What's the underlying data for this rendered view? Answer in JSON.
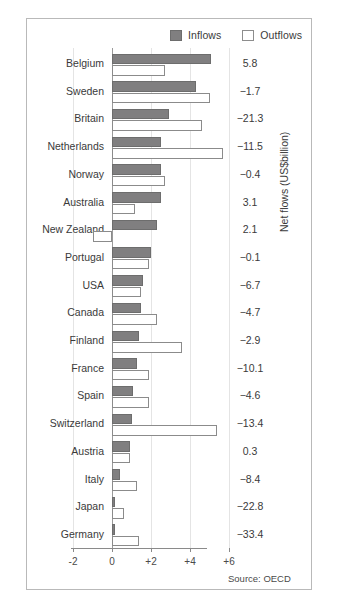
{
  "legend": {
    "inflows_label": "Inflows",
    "outflows_label": "Outflows",
    "inflow_color": "#807f80",
    "outflow_color": "#ffffff"
  },
  "axis": {
    "y_caption": "Net flows (US$billion)",
    "tick_labels": [
      "-2",
      "0",
      "+2",
      "+4",
      "+6"
    ],
    "tick_values": [
      -2,
      0,
      2,
      4,
      6
    ]
  },
  "source_note": "Source: OECD",
  "chart_data": {
    "type": "bar",
    "title": "",
    "xlabel": "",
    "ylabel": "Net flows (US$billion)",
    "xlim": [
      -2,
      6
    ],
    "grid": true,
    "orientation": "horizontal",
    "legend_position": "top-right",
    "categories": [
      "Belgium",
      "Sweden",
      "Britain",
      "Netherlands",
      "Norway",
      "Australia",
      "New Zealand",
      "Portugal",
      "USA",
      "Canada",
      "Finland",
      "France",
      "Spain",
      "Switzerland",
      "Austria",
      "Italy",
      "Japan",
      "Germany"
    ],
    "series": [
      {
        "name": "Inflows",
        "values": [
          5.1,
          4.3,
          2.9,
          2.5,
          2.5,
          2.5,
          2.3,
          2.0,
          1.6,
          1.5,
          1.4,
          1.3,
          1.1,
          1.0,
          0.9,
          0.4,
          0.15,
          0.15
        ]
      },
      {
        "name": "Outflows",
        "values": [
          2.7,
          5.0,
          4.6,
          5.7,
          2.7,
          1.2,
          -1.0,
          1.9,
          1.5,
          2.3,
          3.6,
          1.9,
          1.9,
          5.4,
          0.9,
          1.3,
          0.6,
          1.4
        ]
      }
    ],
    "annotations": {
      "name": "Net flows (US$billion)",
      "values": [
        5.8,
        -1.7,
        -21.3,
        -11.5,
        -0.4,
        3.1,
        2.1,
        -0.1,
        -6.7,
        -4.7,
        -2.9,
        -10.1,
        -4.6,
        -13.4,
        0.3,
        -8.4,
        -22.8,
        -33.4
      ],
      "display": [
        "5.8",
        "−1.7",
        "−21.3",
        "−11.5",
        "−0.4",
        "3.1",
        "2.1",
        "−0.1",
        "−6.7",
        "−4.7",
        "−2.9",
        "−10.1",
        "−4.6",
        "−13.4",
        "0.3",
        "−8.4",
        "−22.8",
        "−33.4"
      ]
    }
  }
}
